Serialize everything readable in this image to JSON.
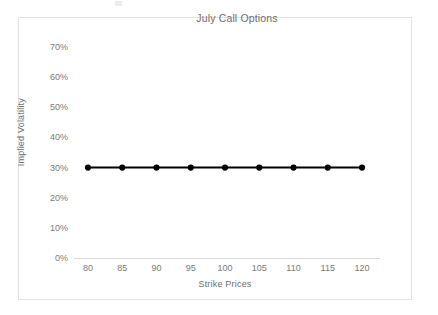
{
  "chart_data": {
    "type": "line",
    "title": "July Call Options",
    "xlabel": "Strike Prices",
    "ylabel": "Implied Volatility",
    "categories": [
      80,
      85,
      90,
      95,
      100,
      105,
      110,
      115,
      120
    ],
    "x_tick_labels": [
      "80",
      "85",
      "90",
      "95",
      "100",
      "105",
      "110",
      "115",
      "120"
    ],
    "y_tick_labels": [
      "0%",
      "10%",
      "20%",
      "30%",
      "40%",
      "50%",
      "60%",
      "70%"
    ],
    "y_tick_values": [
      0,
      10,
      20,
      30,
      40,
      50,
      60,
      70
    ],
    "ylim": [
      0,
      70
    ],
    "grid": false,
    "legend": "none",
    "series": [
      {
        "name": "Implied Volatility",
        "values": [
          30,
          30,
          30,
          30,
          30,
          30,
          30,
          30,
          30
        ],
        "color": "#000000",
        "marker": "circle"
      }
    ]
  },
  "colors": {
    "frame_border": "#e2e2e2",
    "axis_line": "#d9d9d9",
    "tick_text": "#7a7a7a",
    "title_text": "#6d6d6d",
    "series_line": "#000000"
  }
}
